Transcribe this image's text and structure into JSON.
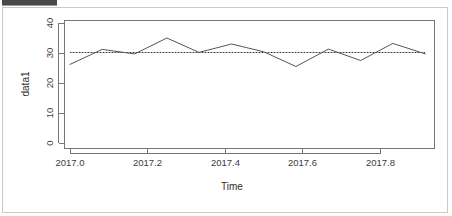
{
  "window": {
    "top_strip_name": "cropped-toolbar-strip",
    "frame_color": "#c9c9c9",
    "background": "#ffffff"
  },
  "chart_data": {
    "type": "line",
    "title": "",
    "subtitle": "",
    "xlabel": "Time",
    "ylabel": "data1",
    "xlim": [
      2017.0,
      2017.9166
    ],
    "ylim": [
      0,
      41
    ],
    "xticks": [
      2017.0,
      2017.2,
      2017.4,
      2017.6,
      2017.8
    ],
    "xtick_labels": [
      "2017.0",
      "2017.2",
      "2017.4",
      "2017.6",
      "2017.8"
    ],
    "yticks": [
      0,
      10,
      20,
      30,
      40
    ],
    "ytick_labels": [
      "0",
      "10",
      "20",
      "30",
      "40"
    ],
    "grid": false,
    "legend": null,
    "legend_position": "none",
    "series": [
      {
        "name": "data1",
        "color": "#555555",
        "style": "solid",
        "x": [
          2017.0,
          2017.083,
          2017.167,
          2017.25,
          2017.333,
          2017.417,
          2017.5,
          2017.583,
          2017.667,
          2017.75,
          2017.833,
          2017.917
        ],
        "values": [
          26.2,
          31.2,
          29.7,
          35.0,
          30.2,
          33.0,
          30.4,
          25.5,
          31.3,
          27.5,
          33.2,
          29.7
        ]
      }
    ],
    "reference_lines": [
      {
        "name": "mean-line",
        "orientation": "horizontal",
        "value": 30.3,
        "style": "dotted",
        "color": "#3a3a3a"
      }
    ],
    "annotations": []
  }
}
